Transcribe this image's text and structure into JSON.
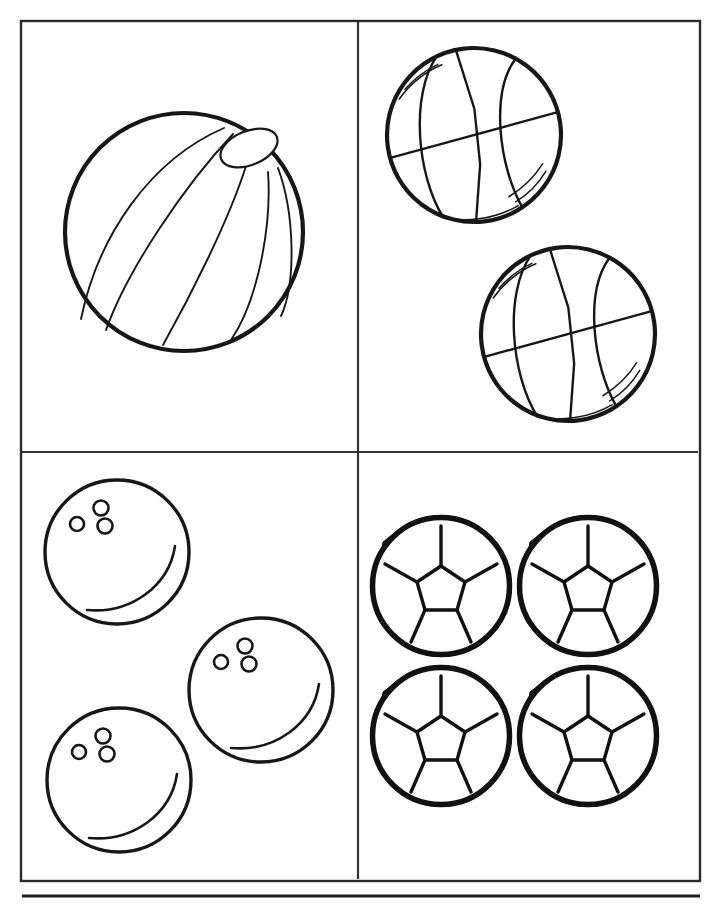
{
  "page": {
    "title": "Sports Balls Coloring Page",
    "background_color": "#ffffff",
    "ink_color": "#171717",
    "width": 722,
    "height": 906
  },
  "frame": {
    "name": "outer-border",
    "x": 20,
    "y": 20,
    "width": 680,
    "height": 861,
    "stroke_color": "#2b2b2b"
  },
  "dividers": {
    "vertical_x": 358,
    "horizontal_y": 452,
    "stroke_color": "#333333"
  },
  "footer": {
    "rule_y": 896,
    "rule_x1": 22,
    "rule_x2": 700,
    "color": "#1f1f1f"
  },
  "panels": [
    {
      "id": "panel-beach-ball",
      "label": "Beach Ball",
      "position": "top-left",
      "ball_type": "beach-ball",
      "count": 1
    },
    {
      "id": "panel-basketball",
      "label": "Basketball",
      "position": "top-right",
      "ball_type": "basketball",
      "count": 2
    },
    {
      "id": "panel-bowling-ball",
      "label": "Bowling Ball",
      "position": "bottom-left",
      "ball_type": "bowling-ball",
      "count": 3
    },
    {
      "id": "panel-soccer-ball",
      "label": "Soccer Ball",
      "position": "bottom-right",
      "ball_type": "soccer-ball",
      "count": 4
    }
  ],
  "beach_ball": {
    "center_x": 184,
    "center_y": 232,
    "radius": 119,
    "cap_center_x": 249,
    "cap_center_y": 148,
    "cap_rx": 30,
    "cap_ry": 17,
    "cap_rotation_deg": -22,
    "segment_count": 5
  },
  "basketballs": [
    {
      "center_x": 474,
      "center_y": 135,
      "radius": 87,
      "tilt_deg": -8
    },
    {
      "center_x": 568,
      "center_y": 334,
      "radius": 87,
      "tilt_deg": -8
    }
  ],
  "bowling_balls": [
    {
      "center_x": 117,
      "center_y": 552,
      "radius": 72,
      "holes": 3
    },
    {
      "center_x": 261,
      "center_y": 690,
      "radius": 72,
      "holes": 3
    },
    {
      "center_x": 119,
      "center_y": 780,
      "radius": 72,
      "holes": 3
    }
  ],
  "soccer_balls": [
    {
      "center_x": 441,
      "center_y": 586,
      "radius": 71
    },
    {
      "center_x": 588,
      "center_y": 586,
      "radius": 71
    },
    {
      "center_x": 441,
      "center_y": 736,
      "radius": 71
    },
    {
      "center_x": 588,
      "center_y": 736,
      "radius": 71
    }
  ]
}
